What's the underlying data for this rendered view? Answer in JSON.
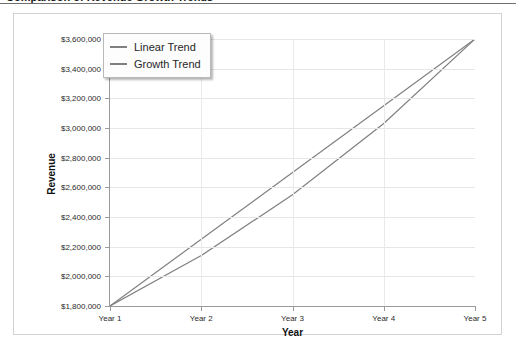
{
  "top_sliver_text": "Comparison of Revenue Growth Trends",
  "chart_data": {
    "type": "line",
    "title": "",
    "xlabel": "Year",
    "ylabel": "Revenue",
    "categories": [
      "Year 1",
      "Year 2",
      "Year 3",
      "Year 4",
      "Year 5"
    ],
    "ylim": [
      1800000,
      3600000
    ],
    "ytick_step": 200000,
    "ytick_labels": [
      "$3,600,000",
      "$3,400,000",
      "$3,200,000",
      "$3,000,000",
      "$2,800,000",
      "$2,600,000",
      "$2,400,000",
      "$2,200,000",
      "$2,000,000",
      "$1,800,000"
    ],
    "ytick_values": [
      3600000,
      3400000,
      3200000,
      3000000,
      2800000,
      2600000,
      2400000,
      2200000,
      2000000,
      1800000
    ],
    "grid": true,
    "legend_position": "top-left",
    "series": [
      {
        "name": "Linear Trend",
        "color": "#808080",
        "values": [
          1800000,
          2250000,
          2700000,
          3150000,
          3600000
        ]
      },
      {
        "name": "Growth Trend",
        "color": "#808080",
        "values": [
          1800000,
          2140000,
          2550000,
          3030000,
          3600000
        ]
      }
    ]
  }
}
